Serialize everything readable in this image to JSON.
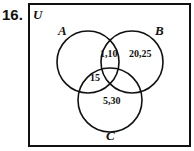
{
  "question_number": "16.",
  "universe_label": "U",
  "sets": {
    "A": {
      "label": "A"
    },
    "B": {
      "label": "B"
    },
    "C": {
      "label": "C"
    }
  },
  "regions": {
    "A_and_B": "1,10",
    "B_only": "20,25",
    "A_and_C": "15",
    "C_only": "5,30"
  },
  "colors": {
    "stroke": "#111111",
    "background": "#ffffff"
  }
}
